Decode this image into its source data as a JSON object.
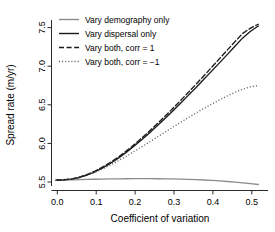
{
  "chart_data": {
    "type": "line",
    "title": "",
    "xlabel": "Coefficient of variation",
    "ylabel": "Spread rate (m/yr)",
    "xlim": [
      -0.012,
      0.545
    ],
    "ylim": [
      5.44,
      7.86
    ],
    "xticks": [
      0.0,
      0.1,
      0.2,
      0.3,
      0.4,
      0.5
    ],
    "xticklabels": [
      "0.0",
      "0.1",
      "0.2",
      "0.3",
      "0.4",
      "0.5"
    ],
    "yticks": [
      5.5,
      6.0,
      6.5,
      7.0,
      7.5
    ],
    "yticklabels": [
      "5.5",
      "6.0",
      "6.5",
      "7.0",
      "7.5"
    ],
    "grid": false,
    "legend_position": "top-left",
    "x": [
      0.0,
      0.02,
      0.04,
      0.06,
      0.08,
      0.1,
      0.12,
      0.14,
      0.16,
      0.18,
      0.2,
      0.22,
      0.24,
      0.26,
      0.28,
      0.3,
      0.32,
      0.34,
      0.36,
      0.38,
      0.4,
      0.42,
      0.44,
      0.46,
      0.48,
      0.5,
      0.52
    ],
    "series": [
      {
        "name": "Vary demography only",
        "color": "#8c8c8c",
        "dash": "solid",
        "values": [
          5.585,
          5.588,
          5.591,
          5.594,
          5.597,
          5.6,
          5.602,
          5.604,
          5.606,
          5.607,
          5.608,
          5.608,
          5.608,
          5.607,
          5.606,
          5.604,
          5.601,
          5.598,
          5.594,
          5.589,
          5.583,
          5.576,
          5.568,
          5.559,
          5.549,
          5.538,
          5.525
        ]
      },
      {
        "name": "Vary dispersal only",
        "color": "#1a1a1a",
        "dash": "solid",
        "values": [
          5.585,
          5.59,
          5.602,
          5.625,
          5.66,
          5.706,
          5.762,
          5.827,
          5.9,
          5.981,
          6.068,
          6.16,
          6.257,
          6.358,
          6.462,
          6.569,
          6.678,
          6.79,
          6.903,
          7.018,
          7.134,
          7.251,
          7.369,
          7.487,
          7.606,
          7.7,
          7.775
        ]
      },
      {
        "name": "Vary both, corr = 1",
        "color": "#1a1a1a",
        "dash": "dashed",
        "values": [
          5.585,
          5.592,
          5.606,
          5.631,
          5.668,
          5.716,
          5.774,
          5.841,
          5.916,
          5.999,
          6.088,
          6.183,
          6.283,
          6.387,
          6.494,
          6.604,
          6.717,
          6.832,
          6.949,
          7.068,
          7.188,
          7.309,
          7.431,
          7.553,
          7.67,
          7.745,
          7.8
        ]
      },
      {
        "name": "Vary both, corr = −1",
        "color": "#555555",
        "dash": "dotted",
        "values": [
          5.585,
          5.59,
          5.603,
          5.626,
          5.659,
          5.7,
          5.749,
          5.803,
          5.862,
          5.925,
          5.991,
          6.059,
          6.128,
          6.198,
          6.268,
          6.338,
          6.407,
          6.475,
          6.541,
          6.605,
          6.667,
          6.726,
          6.781,
          6.833,
          6.879,
          6.912,
          6.93
        ]
      }
    ]
  },
  "legend": {
    "items": [
      {
        "label": "Vary demography only"
      },
      {
        "label": "Vary dispersal only"
      },
      {
        "label": "Vary both, corr = 1"
      },
      {
        "label": "Vary both, corr = −1"
      }
    ]
  },
  "axes": {
    "x_title": "Coefficient of variation",
    "y_title": "Spread rate (m/yr)",
    "x_tick_0": "0.0",
    "x_tick_1": "0.1",
    "x_tick_2": "0.2",
    "x_tick_3": "0.3",
    "x_tick_4": "0.4",
    "x_tick_5": "0.5",
    "y_tick_0": "5.5",
    "y_tick_1": "6.0",
    "y_tick_2": "6.5",
    "y_tick_3": "7.0",
    "y_tick_4": "7.5"
  }
}
